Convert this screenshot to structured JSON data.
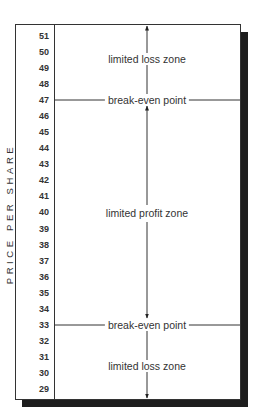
{
  "chart_data": {
    "type": "diagram",
    "title": "",
    "ylabel": "PRICE PER SHARE",
    "y_ticks": [
      51,
      50,
      49,
      48,
      47,
      46,
      45,
      44,
      43,
      42,
      41,
      40,
      39,
      38,
      37,
      36,
      35,
      34,
      33,
      32,
      31,
      30,
      29
    ],
    "ylim": [
      29,
      51
    ],
    "break_even_points": [
      47,
      33
    ],
    "zones": [
      {
        "label": "limited loss zone",
        "from": 47,
        "to": 51,
        "direction": "up"
      },
      {
        "label": "limited profit zone",
        "from": 33,
        "to": 47,
        "direction": "both"
      },
      {
        "label": "limited loss zone",
        "from": 29,
        "to": 33,
        "direction": "down"
      }
    ]
  },
  "axis": {
    "label": "PRICE PER SHARE",
    "ticks": [
      "51",
      "50",
      "49",
      "48",
      "47",
      "46",
      "45",
      "44",
      "43",
      "42",
      "41",
      "40",
      "39",
      "38",
      "37",
      "36",
      "35",
      "34",
      "33",
      "32",
      "31",
      "30",
      "29"
    ]
  },
  "lines": {
    "upper_break_even": "break-even point",
    "lower_break_even": "break-even point"
  },
  "zones": {
    "upper_loss": "limited loss zone",
    "profit": "limited profit zone",
    "lower_loss": "limited loss zone"
  },
  "colors": {
    "ink": "#333333",
    "shadow": "#1e1e1e",
    "background": "#ffffff"
  }
}
